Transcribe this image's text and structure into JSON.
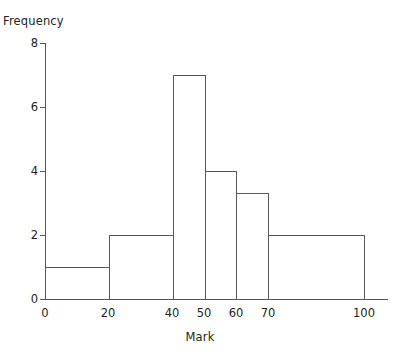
{
  "chart_data": {
    "type": "bar",
    "subtype": "histogram",
    "title": "",
    "xlabel": "Mark",
    "ylabel": "Frequency",
    "xlim": [
      0,
      107
    ],
    "ylim": [
      0,
      8
    ],
    "grid": false,
    "legend": null,
    "xticks": [
      0,
      20,
      40,
      50,
      60,
      70,
      100
    ],
    "xtick_labels": [
      "0",
      "20",
      "40",
      "50",
      "60",
      "70",
      "100"
    ],
    "yticks": [
      0,
      2,
      4,
      6,
      8
    ],
    "ytick_labels": [
      "0",
      "2",
      "4",
      "6",
      "8"
    ],
    "bins": [
      {
        "label": "0-20",
        "x0": 0,
        "x1": 20,
        "frequency": 1
      },
      {
        "label": "20-40",
        "x0": 20,
        "x1": 40,
        "frequency": 2
      },
      {
        "label": "40-50",
        "x0": 40,
        "x1": 50,
        "frequency": 7
      },
      {
        "label": "50-60",
        "x0": 50,
        "x1": 60,
        "frequency": 4
      },
      {
        "label": "60-70",
        "x0": 60,
        "x1": 70,
        "frequency": 3.3
      },
      {
        "label": "70-100",
        "x0": 70,
        "x1": 100,
        "frequency": 2
      }
    ],
    "categories": [
      "0-20",
      "20-40",
      "40-50",
      "50-60",
      "60-70",
      "70-100"
    ],
    "values": [
      1,
      2,
      7,
      4,
      3.3,
      2
    ],
    "colors": {
      "bar_fill": "#ffffff",
      "bar_stroke": "#58585a",
      "axis": "#58585a",
      "text": "#231f20",
      "background": "#ffffff"
    }
  }
}
